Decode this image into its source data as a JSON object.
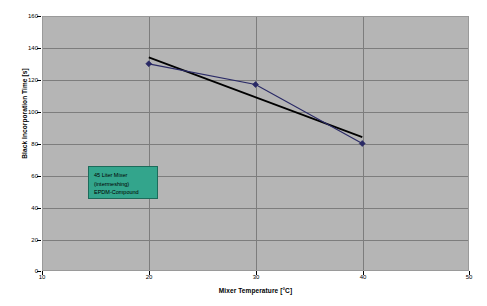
{
  "chart_data": {
    "type": "line",
    "title": "",
    "xlabel": "Mixer Temperature [°C]",
    "ylabel": "Black Incorporation Time [s]",
    "xlim": [
      10,
      50
    ],
    "ylim": [
      0,
      160
    ],
    "xticks": [
      10,
      20,
      30,
      40,
      50
    ],
    "yticks": [
      0,
      20,
      40,
      60,
      80,
      100,
      120,
      140,
      160
    ],
    "grid": true,
    "legend": "none",
    "plot_background": "#b5b5b5",
    "series": [
      {
        "name": "Black Incorporation Time",
        "type": "line",
        "color": "#2a2a66",
        "marker": "diamond",
        "x": [
          20,
          30,
          40
        ],
        "values": [
          130,
          117,
          80
        ]
      },
      {
        "name": "Linear trendline",
        "type": "trendline",
        "color": "#000000",
        "marker": "none",
        "x": [
          20,
          40
        ],
        "values": [
          134,
          84
        ]
      }
    ],
    "annotations": [
      {
        "name": "mixer-info-box",
        "lines": [
          "45 Liter Mixer",
          "(intermeshing)",
          "EPDM-Compound"
        ],
        "fill": "#33a58c",
        "border": "#1c6b5a"
      }
    ]
  },
  "axes": {
    "y_tick_labels": [
      "160",
      "140",
      "120",
      "100",
      "80",
      "60",
      "40",
      "20",
      "0"
    ],
    "x_tick_labels": [
      "10",
      "20",
      "30",
      "40",
      "50"
    ],
    "y_title": "Black Incorporation Time [s]",
    "x_title": "Mixer Temperature [°C]"
  },
  "annotation": {
    "line1": "45 Liter Mixer",
    "line2": "(intermeshing)",
    "line3": "EPDM-Compound"
  }
}
